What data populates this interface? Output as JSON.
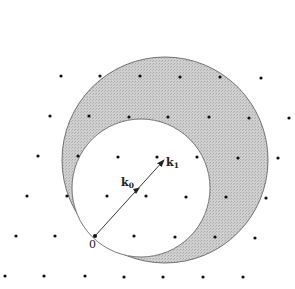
{
  "figure": {
    "origin_label": "0",
    "vectors": [
      {
        "name": "k0",
        "label": "k",
        "subscript": "0"
      },
      {
        "name": "k1",
        "label": "k",
        "subscript": "1"
      }
    ],
    "colors": {
      "shaded_region": "#c4c4c4",
      "outline": "#555555",
      "dots": "#111111",
      "arrow": "#222222"
    },
    "big_circle": {
      "cx": 165,
      "cy": 160,
      "r": 103
    },
    "small_circle": {
      "cx": 141,
      "cy": 188,
      "r": 69
    },
    "origin": {
      "x": 95,
      "y": 236
    },
    "k0_tip": {
      "x": 137,
      "y": 191
    },
    "k1_tip": {
      "x": 164,
      "y": 160
    },
    "lattice_points": [
      [
        61,
        76
      ],
      [
        100,
        76
      ],
      [
        140,
        76
      ],
      [
        180,
        77
      ],
      [
        220,
        77
      ],
      [
        261,
        78
      ],
      [
        50,
        116
      ],
      [
        89,
        116
      ],
      [
        129,
        117
      ],
      [
        168,
        117
      ],
      [
        209,
        117
      ],
      [
        249,
        118
      ],
      [
        289,
        118
      ],
      [
        38,
        156
      ],
      [
        78,
        156
      ],
      [
        118,
        157
      ],
      [
        157,
        157
      ],
      [
        197,
        157
      ],
      [
        238,
        158
      ],
      [
        278,
        158
      ],
      [
        27,
        196
      ],
      [
        67,
        196
      ],
      [
        107,
        196
      ],
      [
        146,
        196
      ],
      [
        186,
        197
      ],
      [
        226,
        197
      ],
      [
        266,
        198
      ],
      [
        16,
        236
      ],
      [
        55,
        236
      ],
      [
        134,
        236
      ],
      [
        175,
        237
      ],
      [
        215,
        237
      ],
      [
        255,
        238
      ],
      [
        5,
        276
      ],
      [
        44,
        276
      ],
      [
        85,
        276
      ],
      [
        124,
        277
      ],
      [
        163,
        277
      ],
      [
        203,
        277
      ],
      [
        243,
        277
      ]
    ]
  }
}
